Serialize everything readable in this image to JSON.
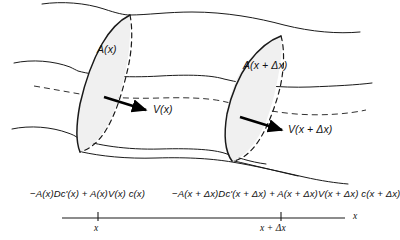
{
  "figure": {
    "type": "stream-tube-flux-diagram",
    "colors": {
      "stroke": "#1a1a1a",
      "cross_section_fill": "#f0f0f0",
      "background": "#ffffff",
      "arrow": "#000000"
    }
  },
  "labels": {
    "area_left": "A(x)",
    "area_right": "A(x + Δx)",
    "velocity_left": "V(x)",
    "velocity_right": "V(x + Δx)"
  },
  "flux_expressions": {
    "left": "−A(x)Dc'(x) + A(x)V(x) c(x)",
    "right": "−A(x + Δx)Dc'(x + Δx) + A(x + Δx)V(x + Δx) c(x + Δx)"
  },
  "axis": {
    "label": "x",
    "ticks": [
      {
        "label": "x",
        "position": 98
      },
      {
        "label": "x + Δx",
        "position": 281
      }
    ],
    "line": {
      "x_start": 62,
      "x_end": 345,
      "y": 218
    }
  },
  "arrows": [
    {
      "name": "velocity-arrow-left",
      "from": [
        104,
        97
      ],
      "to": [
        148,
        110
      ]
    },
    {
      "name": "velocity-arrow-right",
      "from": [
        240,
        117
      ],
      "to": [
        284,
        130
      ]
    }
  ],
  "cross_sections": [
    {
      "name": "cross-section-left",
      "area_label": "A(x)",
      "x_position": "x"
    },
    {
      "name": "cross-section-right",
      "area_label": "A(x + Δx)",
      "x_position": "x + Δx"
    }
  ]
}
